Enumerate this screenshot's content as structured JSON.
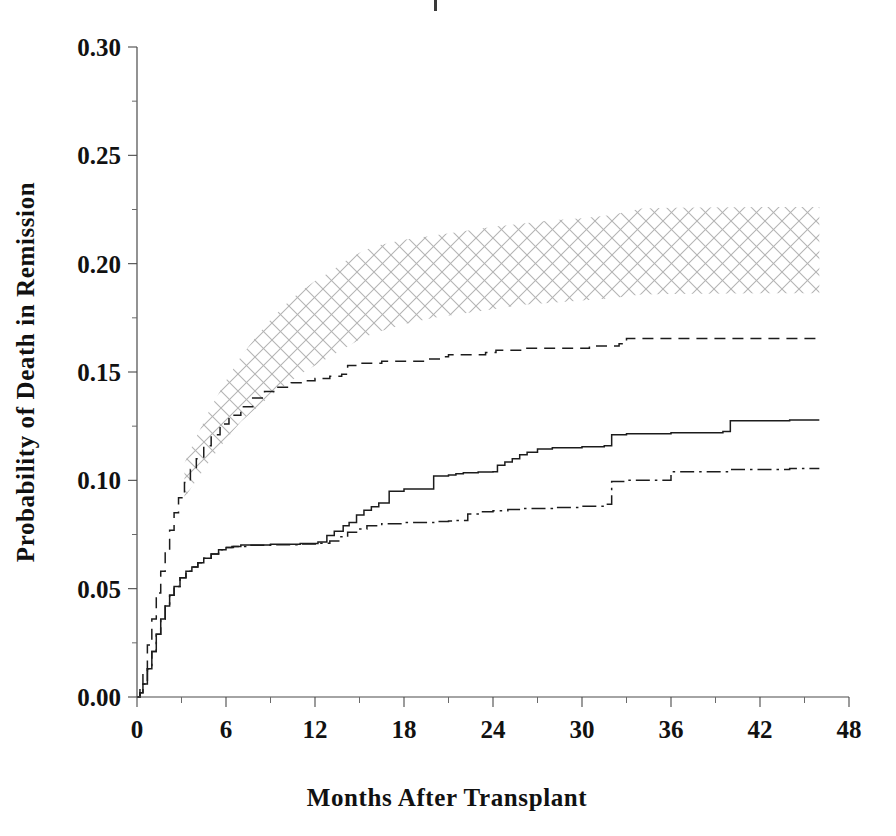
{
  "figure": {
    "background_color": "#ffffff",
    "ink_color": "#1c1c1c",
    "axis_color": "#4a4a4a",
    "band_color": "#b9b9b9"
  },
  "chart_data": {
    "type": "line",
    "title": "",
    "subtitle": "",
    "xlabel": "Months After Transplant",
    "ylabel": "Probability of Death in Remission",
    "xlim": [
      0,
      48
    ],
    "ylim": [
      0.0,
      0.3
    ],
    "grid": false,
    "legend_position": "none",
    "xticks": [
      0,
      6,
      12,
      18,
      24,
      30,
      36,
      42,
      48
    ],
    "xtick_labels": [
      "0",
      "6",
      "12",
      "18",
      "24",
      "30",
      "36",
      "42",
      "48"
    ],
    "xminor_tick_step": 3,
    "yticks": [
      0.0,
      0.05,
      0.1,
      0.15,
      0.2,
      0.25,
      0.3
    ],
    "ytick_labels": [
      "0.00",
      "0.05",
      "0.10",
      "0.15",
      "0.20",
      "0.25",
      "0.30"
    ],
    "yminor_tick_step": 0.025,
    "annotations": [],
    "series": [
      {
        "name": "upper-dashed-curve",
        "style": "dashed",
        "x": [
          0,
          0.2,
          0.4,
          0.7,
          1.0,
          1.3,
          1.6,
          1.9,
          2.2,
          2.5,
          2.8,
          3.2,
          3.6,
          4.0,
          4.5,
          5.0,
          5.6,
          6.2,
          7.0,
          7.8,
          8.6,
          9.5,
          10.4,
          11.2,
          12.0,
          13.0,
          13.8,
          14.2,
          15.0,
          16.5,
          18.0,
          19.5,
          20.5,
          21.0,
          22.0,
          23.5,
          24.2,
          25.0,
          26.0,
          27.5,
          29.0,
          30.5,
          31.5,
          32.5,
          33.0,
          36.0,
          40.0,
          44.0,
          46.0
        ],
        "y": [
          0.0,
          0.004,
          0.012,
          0.024,
          0.036,
          0.048,
          0.058,
          0.068,
          0.077,
          0.085,
          0.092,
          0.099,
          0.105,
          0.11,
          0.116,
          0.121,
          0.126,
          0.13,
          0.134,
          0.138,
          0.141,
          0.143,
          0.145,
          0.146,
          0.147,
          0.148,
          0.149,
          0.153,
          0.154,
          0.155,
          0.155,
          0.156,
          0.157,
          0.158,
          0.158,
          0.159,
          0.16,
          0.16,
          0.161,
          0.161,
          0.161,
          0.162,
          0.162,
          0.163,
          0.1655,
          0.1655,
          0.1655,
          0.1655,
          0.1655
        ]
      },
      {
        "name": "middle-solid-curve",
        "style": "solid",
        "x": [
          0,
          0.2,
          0.4,
          0.7,
          1.0,
          1.3,
          1.6,
          1.9,
          2.2,
          2.5,
          2.9,
          3.3,
          3.7,
          4.1,
          4.5,
          5.0,
          5.5,
          6.0,
          6.4,
          7.0,
          9.0,
          11.0,
          12.2,
          12.8,
          13.3,
          13.9,
          14.3,
          14.8,
          15.3,
          15.8,
          16.3,
          17.0,
          18.0,
          20.0,
          21.0,
          21.5,
          22.0,
          23.0,
          24.0,
          24.3,
          24.8,
          25.3,
          25.8,
          26.3,
          27.0,
          28.0,
          30.0,
          31.5,
          32.0,
          33.0,
          36.0,
          39.5,
          40.0,
          44.0,
          46.0
        ],
        "y": [
          0.0,
          0.002,
          0.006,
          0.013,
          0.021,
          0.029,
          0.036,
          0.042,
          0.047,
          0.051,
          0.055,
          0.058,
          0.06,
          0.062,
          0.064,
          0.066,
          0.068,
          0.069,
          0.0695,
          0.0702,
          0.0705,
          0.0708,
          0.0715,
          0.0745,
          0.0765,
          0.079,
          0.0805,
          0.084,
          0.0862,
          0.0878,
          0.0895,
          0.095,
          0.096,
          0.102,
          0.1025,
          0.103,
          0.1035,
          0.1038,
          0.104,
          0.107,
          0.1085,
          0.11,
          0.1118,
          0.113,
          0.1145,
          0.115,
          0.1155,
          0.116,
          0.121,
          0.1215,
          0.122,
          0.1225,
          0.1275,
          0.1278,
          0.1278
        ]
      },
      {
        "name": "lower-dashdot-curve",
        "style": "dashdot",
        "x": [
          0,
          0.2,
          0.4,
          0.7,
          1.0,
          1.3,
          1.6,
          1.9,
          2.2,
          2.5,
          2.9,
          3.3,
          3.7,
          4.1,
          4.5,
          5.0,
          5.5,
          6.0,
          6.5,
          7.5,
          9.0,
          11.0,
          12.3,
          13.0,
          13.6,
          14.2,
          14.8,
          15.5,
          16.5,
          18.0,
          20.0,
          21.0,
          21.5,
          22.3,
          23.0,
          24.0,
          25.0,
          26.0,
          28.0,
          30.0,
          31.5,
          32.0,
          33.0,
          36.0,
          40.0,
          44.0,
          46.0
        ],
        "y": [
          0.0,
          0.002,
          0.006,
          0.013,
          0.021,
          0.029,
          0.036,
          0.042,
          0.047,
          0.051,
          0.055,
          0.058,
          0.06,
          0.062,
          0.064,
          0.066,
          0.068,
          0.069,
          0.0695,
          0.07,
          0.0703,
          0.0706,
          0.071,
          0.072,
          0.074,
          0.076,
          0.0775,
          0.079,
          0.08,
          0.0805,
          0.081,
          0.0812,
          0.0815,
          0.0845,
          0.0855,
          0.086,
          0.0865,
          0.087,
          0.0875,
          0.088,
          0.089,
          0.0995,
          0.1,
          0.104,
          0.105,
          0.1055,
          0.1055
        ]
      }
    ],
    "band": {
      "name": "crosshatched-confidence-band",
      "pattern": "crosshatch",
      "x": [
        3.2,
        4.0,
        5.0,
        6.0,
        7.0,
        8.0,
        9.0,
        10.0,
        11.0,
        12.0,
        13.0,
        14.0,
        15.0,
        16.0,
        18.0,
        20.0,
        22.0,
        24.0,
        26.0,
        28.0,
        30.0,
        32.0,
        34.0,
        36.0,
        40.0,
        44.0,
        46.0
      ],
      "y_upper": [
        0.108,
        0.12,
        0.134,
        0.146,
        0.157,
        0.166,
        0.174,
        0.181,
        0.187,
        0.192,
        0.196,
        0.201,
        0.205,
        0.208,
        0.211,
        0.213,
        0.215,
        0.217,
        0.2185,
        0.22,
        0.221,
        0.2225,
        0.2255,
        0.2258,
        0.226,
        0.2262,
        0.2262
      ],
      "y_lower": [
        0.092,
        0.1,
        0.11,
        0.119,
        0.127,
        0.133,
        0.139,
        0.144,
        0.149,
        0.153,
        0.157,
        0.161,
        0.165,
        0.168,
        0.172,
        0.175,
        0.177,
        0.179,
        0.181,
        0.182,
        0.183,
        0.184,
        0.1858,
        0.186,
        0.1862,
        0.1864,
        0.1864
      ]
    }
  }
}
